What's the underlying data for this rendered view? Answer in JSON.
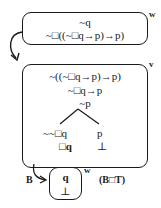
{
  "diagram": {
    "world_w": {
      "label": "w",
      "lines": [
        "~q",
        "~□((~□q→p)→p)"
      ]
    },
    "world_v": {
      "label": "v",
      "lines": [
        "~((~□q→p)→p)",
        "~□q→p",
        "~p"
      ],
      "branches": {
        "left": [
          "~~□q",
          "□q"
        ],
        "right": [
          "p",
          "⊥"
        ]
      }
    },
    "world_w2": {
      "label": "w",
      "lines": [
        "q",
        "⊥"
      ]
    },
    "arrow_label": "B",
    "rule_label": "(B□T)"
  }
}
